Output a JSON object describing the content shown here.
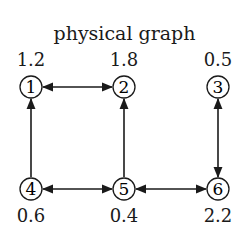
{
  "title": "physical graph",
  "nodes": [
    {
      "id": "1",
      "label": "1",
      "value": "1.2",
      "x": 31,
      "y": 87
    },
    {
      "id": "2",
      "label": "2",
      "value": "1.8",
      "x": 124,
      "y": 87
    },
    {
      "id": "3",
      "label": "3",
      "value": "0.5",
      "x": 218,
      "y": 87
    },
    {
      "id": "4",
      "label": "4",
      "value": "0.6",
      "x": 31,
      "y": 189
    },
    {
      "id": "5",
      "label": "5",
      "value": "0.4",
      "x": 124,
      "y": 189
    },
    {
      "id": "6",
      "label": "6",
      "value": "2.2",
      "x": 218,
      "y": 189
    }
  ],
  "edges": [
    {
      "from": "1",
      "to": "2",
      "direction": "bidirectional"
    },
    {
      "from": "4",
      "to": "1",
      "direction": "directed"
    },
    {
      "from": "5",
      "to": "2",
      "direction": "directed"
    },
    {
      "from": "3",
      "to": "6",
      "direction": "bidirectional"
    },
    {
      "from": "4",
      "to": "5",
      "direction": "bidirectional"
    },
    {
      "from": "5",
      "to": "6",
      "direction": "bidirectional"
    }
  ],
  "colors": {
    "stroke": "#1a1a1a",
    "background": "#ffffff"
  }
}
